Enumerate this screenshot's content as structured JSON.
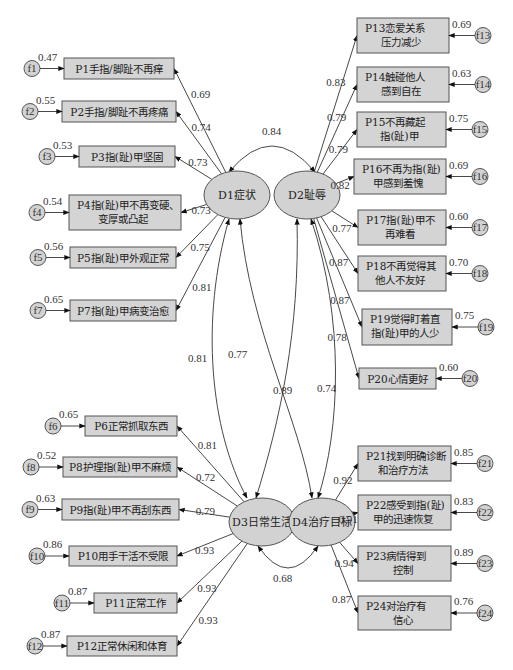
{
  "latents": [
    {
      "id": "D1",
      "label": "D1症状",
      "cx": 237,
      "cy": 195
    },
    {
      "id": "D2",
      "label": "D2耻辱",
      "cx": 307,
      "cy": 195
    },
    {
      "id": "D3",
      "label": "D3日常生活",
      "cx": 262,
      "cy": 522
    },
    {
      "id": "D4",
      "label": "D4治疗目标",
      "cx": 322,
      "cy": 522
    }
  ],
  "indicators": [
    {
      "id": "P1",
      "lines": [
        "P1手指/脚趾不再痒"
      ],
      "x": 64,
      "y": 58,
      "w": 110,
      "h": 21,
      "latent": "D1",
      "loading": "0.69",
      "err": "f1",
      "err_value": "0.47",
      "side": "left"
    },
    {
      "id": "P2",
      "lines": [
        "P2手指/脚趾不再疼痛"
      ],
      "x": 62,
      "y": 101,
      "w": 114,
      "h": 21,
      "latent": "D1",
      "loading": "0.74",
      "err": "f2",
      "err_value": "0.55",
      "side": "left"
    },
    {
      "id": "P3",
      "lines": [
        "P3指(趾)甲坚固"
      ],
      "x": 79,
      "y": 146,
      "w": 96,
      "h": 21,
      "latent": "D1",
      "loading": "0.73",
      "err": "f3",
      "err_value": "0.53",
      "side": "left"
    },
    {
      "id": "P4",
      "lines": [
        "P4指(趾)甲不再变硬、",
        "变厚或凸起"
      ],
      "x": 69,
      "y": 195,
      "w": 112,
      "h": 35,
      "latent": "D1",
      "loading": "0.73",
      "err": "f4",
      "err_value": "0.54",
      "side": "left"
    },
    {
      "id": "P5",
      "lines": [
        "P5指(趾)甲外观正常"
      ],
      "x": 70,
      "y": 247,
      "w": 106,
      "h": 21,
      "latent": "D1",
      "loading": "0.75",
      "err": "f5",
      "err_value": "0.56",
      "side": "left"
    },
    {
      "id": "P7",
      "lines": [
        "P7指(趾)甲病变治愈"
      ],
      "x": 70,
      "y": 300,
      "w": 106,
      "h": 21,
      "latent": "D1",
      "loading": "0.81",
      "err": "f7",
      "err_value": "0.65",
      "side": "left"
    },
    {
      "id": "P6",
      "lines": [
        "P6正常抓取东西"
      ],
      "x": 85,
      "y": 416,
      "w": 92,
      "h": 20,
      "latent": "D3",
      "loading": "0.81",
      "err": "f6",
      "err_value": "0.65",
      "side": "left"
    },
    {
      "id": "P8",
      "lines": [
        "P8护理指(趾)甲不麻烦"
      ],
      "x": 63,
      "y": 457,
      "w": 114,
      "h": 20,
      "latent": "D3",
      "loading": "0.72",
      "err": "f8",
      "err_value": "0.52",
      "side": "left"
    },
    {
      "id": "P9",
      "lines": [
        "P9指(趾)甲不再刮东西"
      ],
      "x": 62,
      "y": 499,
      "w": 117,
      "h": 21,
      "latent": "D3",
      "loading": "0.79",
      "err": "f9",
      "err_value": "0.63",
      "side": "left"
    },
    {
      "id": "P10",
      "lines": [
        "P10用手干活不受限"
      ],
      "x": 69,
      "y": 546,
      "w": 108,
      "h": 20,
      "latent": "D3",
      "loading": "0.93",
      "err": "f10",
      "err_value": "0.86",
      "side": "left"
    },
    {
      "id": "P11",
      "lines": [
        "P11正常工作"
      ],
      "x": 94,
      "y": 593,
      "w": 83,
      "h": 20,
      "latent": "D3",
      "loading": "0.93",
      "err": "f11",
      "err_value": "0.87",
      "side": "left"
    },
    {
      "id": "P12",
      "lines": [
        "P12正常休闲和体育"
      ],
      "x": 67,
      "y": 636,
      "w": 110,
      "h": 20,
      "latent": "D3",
      "loading": "0.93",
      "err": "f12",
      "err_value": "0.87",
      "side": "left"
    },
    {
      "id": "P13",
      "lines": [
        "P13恋爱关系",
        "压力减少"
      ],
      "x": 357,
      "y": 18,
      "w": 92,
      "h": 35,
      "latent": "D2",
      "loading": "0.83",
      "err": "f13",
      "err_value": "0.69",
      "side": "right"
    },
    {
      "id": "P14",
      "lines": [
        "P14触碰他人",
        "感到自在"
      ],
      "x": 357,
      "y": 67,
      "w": 92,
      "h": 35,
      "latent": "D2",
      "loading": "0.79",
      "err": "f14",
      "err_value": "0.63",
      "side": "right"
    },
    {
      "id": "P15",
      "lines": [
        "P15不再藏起",
        "指(趾)甲"
      ],
      "x": 357,
      "y": 112,
      "w": 89,
      "h": 35,
      "latent": "D2",
      "loading": "0.79",
      "err": "f15",
      "err_value": "0.75",
      "side": "right"
    },
    {
      "id": "P16",
      "lines": [
        "P16不再为指(趾)",
        "甲感到羞愧"
      ],
      "x": 354,
      "y": 159,
      "w": 92,
      "h": 35,
      "latent": "D2",
      "loading": "0.82",
      "err": "f16",
      "err_value": "0.69",
      "side": "right"
    },
    {
      "id": "P17",
      "lines": [
        "P17指(趾)甲不",
        "再难看"
      ],
      "x": 358,
      "y": 210,
      "w": 88,
      "h": 35,
      "latent": "D2",
      "loading": "0.77",
      "err": "f17",
      "err_value": "0.60",
      "side": "right"
    },
    {
      "id": "P18",
      "lines": [
        "P18不再觉得其",
        "他人不友好"
      ],
      "x": 358,
      "y": 256,
      "w": 88,
      "h": 35,
      "latent": "D2",
      "loading": "0.87",
      "err": "f18",
      "err_value": "0.70",
      "side": "right"
    },
    {
      "id": "P19",
      "lines": [
        "P19觉得盯着直",
        "指(趾)甲的人少"
      ],
      "x": 362,
      "y": 309,
      "w": 90,
      "h": 36,
      "latent": "D2",
      "loading": "0.87",
      "err": "f19",
      "err_value": "0.75",
      "side": "right"
    },
    {
      "id": "P20",
      "lines": [
        "P20心情更好"
      ],
      "x": 359,
      "y": 368,
      "w": 77,
      "h": 21,
      "latent": "D2",
      "loading": "0.78",
      "err": "f20",
      "err_value": "0.60",
      "side": "right"
    },
    {
      "id": "P21",
      "lines": [
        "P21找到明确诊断",
        "和治疗方法"
      ],
      "x": 358,
      "y": 446,
      "w": 93,
      "h": 35,
      "latent": "D4",
      "loading": "0.92",
      "err": "f21",
      "err_value": "0.85",
      "side": "right"
    },
    {
      "id": "P22",
      "lines": [
        "P22感受到指(趾)",
        "甲的迅速恢复"
      ],
      "x": 358,
      "y": 495,
      "w": 93,
      "h": 35,
      "latent": "D4",
      "loading": "0.91",
      "err": "f22",
      "err_value": "0.83",
      "side": "right"
    },
    {
      "id": "P23",
      "lines": [
        "P23病情得到",
        "控制"
      ],
      "x": 358,
      "y": 546,
      "w": 93,
      "h": 35,
      "latent": "D4",
      "loading": "0.94",
      "err": "f23",
      "err_value": "0.89",
      "side": "right"
    },
    {
      "id": "P24",
      "lines": [
        "P24对治疗有",
        "信心"
      ],
      "x": 358,
      "y": 596,
      "w": 93,
      "h": 34,
      "latent": "D4",
      "loading": "0.87",
      "err": "f24",
      "err_value": "0.76",
      "side": "right"
    }
  ],
  "correlations": [
    {
      "from": "D1",
      "to": "D2",
      "value": "0.84"
    },
    {
      "from": "D1",
      "to": "D3",
      "value": "0.81"
    },
    {
      "from": "D1",
      "to": "D4",
      "value": "0.77"
    },
    {
      "from": "D2",
      "to": "D3",
      "value": "0.89"
    },
    {
      "from": "D2",
      "to": "D4",
      "value": "0.74"
    },
    {
      "from": "D3",
      "to": "D4",
      "value": "0.68"
    }
  ],
  "labels": {
    "D1_D2": "0.84",
    "D1_D3": "0.81",
    "D1_D4": "0.77",
    "D2_D3": "0.89",
    "D2_D4": "0.74",
    "D3_D4": "0.68"
  }
}
